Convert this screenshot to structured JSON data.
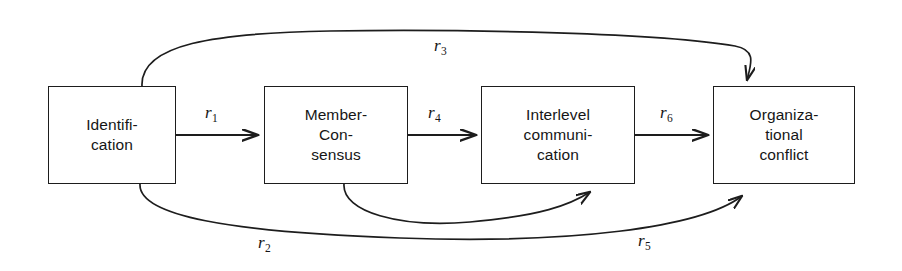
{
  "diagram": {
    "background_color": "#ffffff",
    "stroke_color": "#1d1d1d",
    "nodes": [
      {
        "id": "identification",
        "lines": [
          "Identifi-",
          "cation"
        ],
        "x": 48,
        "y": 86,
        "width": 128,
        "height": 98
      },
      {
        "id": "member-consensus",
        "lines": [
          "Member-",
          "Con-",
          "sensus"
        ],
        "x": 264,
        "y": 86,
        "width": 144,
        "height": 98
      },
      {
        "id": "interlevel-communication",
        "lines": [
          "Interlevel",
          "communi-",
          "cation"
        ],
        "x": 481,
        "y": 86,
        "width": 154,
        "height": 98
      },
      {
        "id": "organizational-conflict",
        "lines": [
          "Organiza-",
          "tional",
          "conflict"
        ],
        "x": 713,
        "y": 86,
        "width": 142,
        "height": 98
      }
    ],
    "edges": [
      {
        "id": "r1",
        "label": "r",
        "subscript": "1",
        "from": "identification",
        "to": "member-consensus",
        "shape": "straight",
        "label_x": 205,
        "label_y": 104
      },
      {
        "id": "r4",
        "label": "r",
        "subscript": "4",
        "from": "member-consensus",
        "to": "interlevel-communication",
        "shape": "straight",
        "label_x": 428,
        "label_y": 104
      },
      {
        "id": "r6",
        "label": "r",
        "subscript": "6",
        "from": "interlevel-communication",
        "to": "organizational-conflict",
        "shape": "straight",
        "label_x": 660,
        "label_y": 104
      },
      {
        "id": "r3",
        "label": "r",
        "subscript": "3",
        "from": "identification",
        "to": "organizational-conflict",
        "shape": "curve-top",
        "label_x": 434,
        "label_y": 37
      },
      {
        "id": "r2",
        "label": "r",
        "subscript": "2",
        "from": "identification",
        "to": "organizational-conflict",
        "shape": "curve-bottom",
        "label_x": 258,
        "label_y": 234
      },
      {
        "id": "r5",
        "label": "r",
        "subscript": "5",
        "from": "member-consensus",
        "to": "interlevel-communication",
        "shape": "curve-bottom-cross",
        "label_x": 638,
        "label_y": 232
      }
    ]
  }
}
